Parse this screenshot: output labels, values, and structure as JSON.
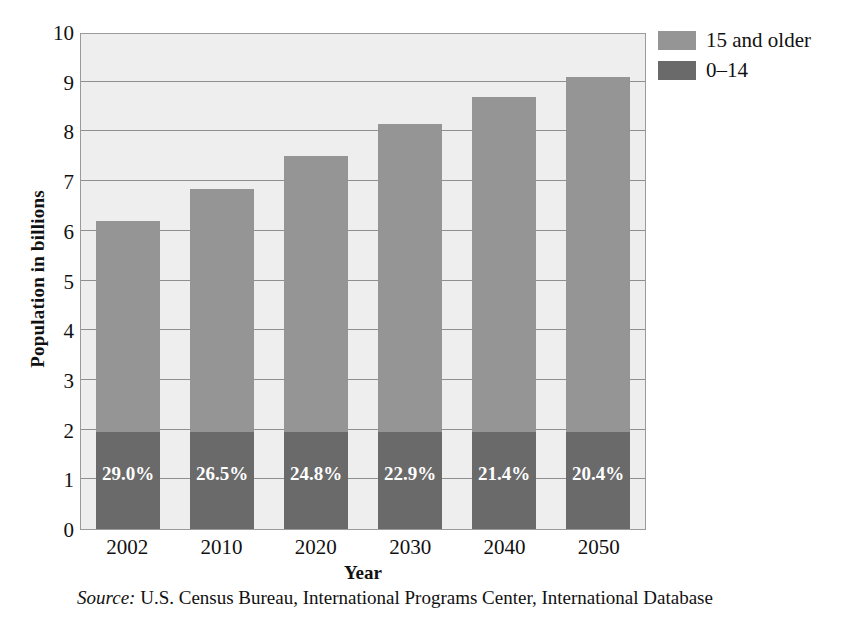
{
  "chart_data": {
    "type": "bar",
    "subtype": "stacked",
    "title": "",
    "xlabel": "Year",
    "ylabel": "Population in billions",
    "categories": [
      "2002",
      "2010",
      "2020",
      "2030",
      "2040",
      "2050"
    ],
    "ylim": [
      0,
      10
    ],
    "yticks": [
      0,
      1,
      2,
      3,
      4,
      5,
      6,
      7,
      8,
      9,
      10
    ],
    "ytick_labels": [
      "0",
      "1",
      "2",
      "3",
      "4",
      "5",
      "6",
      "7",
      "8",
      "9",
      "10"
    ],
    "grid": true,
    "legend_position": "top-right",
    "series": [
      {
        "name": "0–14",
        "color": "#6a6a6a",
        "values": [
          1.96,
          1.96,
          1.96,
          1.96,
          1.96,
          1.96
        ]
      },
      {
        "name": "15 and older",
        "color": "#959595",
        "values": [
          4.24,
          4.89,
          5.54,
          6.19,
          6.74,
          7.14
        ]
      }
    ],
    "totals": [
      6.2,
      6.85,
      7.5,
      8.15,
      8.7,
      9.1
    ],
    "data_labels": [
      "29.0%",
      "26.5%",
      "24.8%",
      "22.9%",
      "21.4%",
      "20.4%"
    ],
    "data_label_note": "percent of total population aged 0–14",
    "annotations": []
  },
  "legend": {
    "items": [
      {
        "label": "15 and older",
        "color": "#959595"
      },
      {
        "label": "0–14",
        "color": "#6a6a6a"
      }
    ]
  },
  "source": {
    "prefix": "Source:",
    "text": " U.S. Census Bureau, International Programs Center, International Database"
  },
  "colors": {
    "page_background": "#ffffff",
    "plot_background": "#eeeeee",
    "gridline": "#8f8f8f",
    "axis_border": "#9a9a9a",
    "bar_upper": "#959595",
    "bar_lower": "#6a6a6a",
    "label_text": "#ffffff",
    "text": "#111111"
  }
}
